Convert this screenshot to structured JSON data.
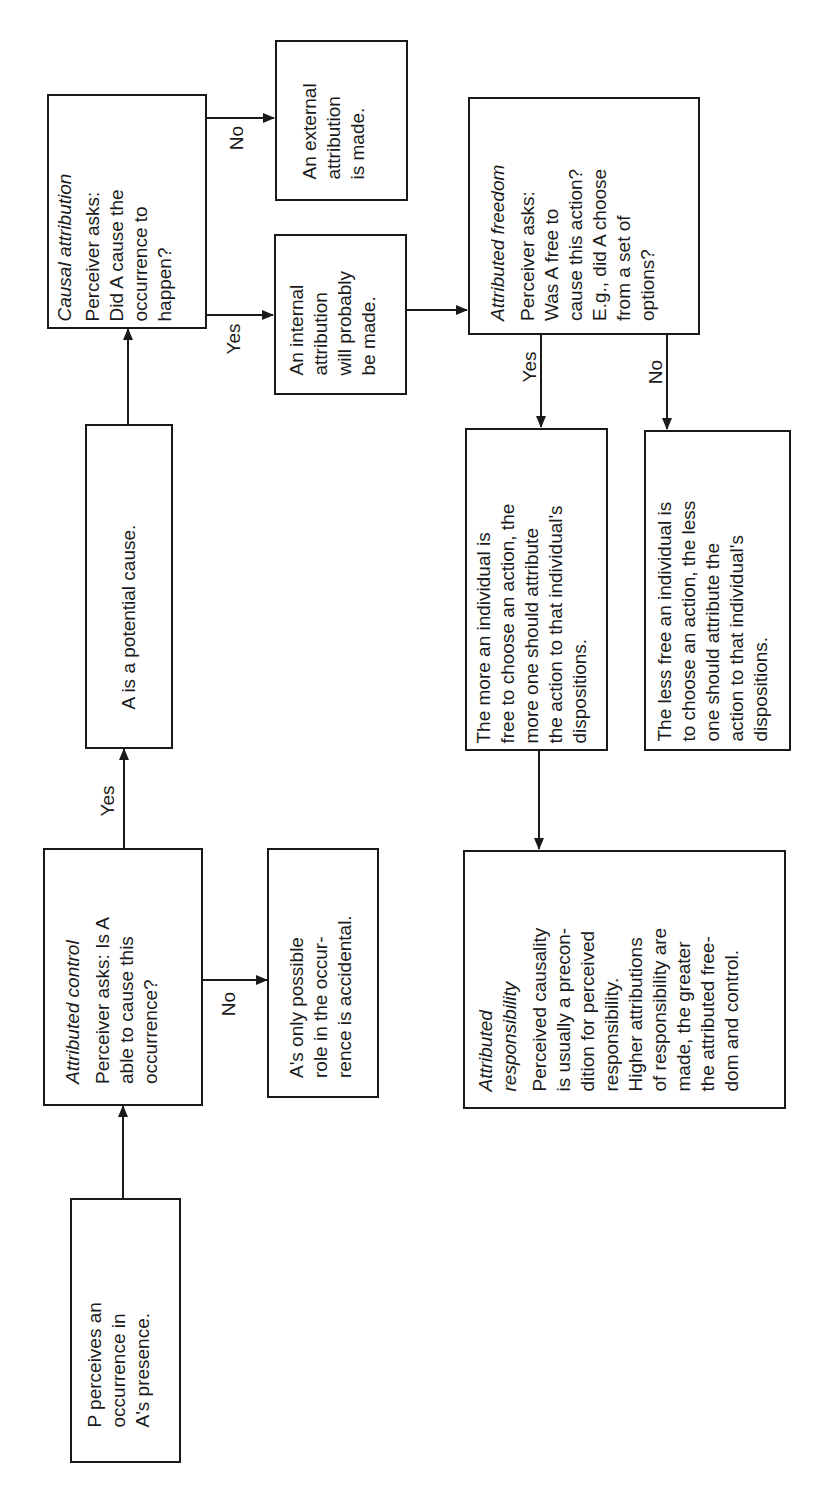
{
  "diagram": {
    "orientation": "rotated 90 degrees counter-clockwise",
    "nodes": {
      "start": {
        "lines": [
          "P perceives an",
          "occurrence in",
          "A's presence."
        ]
      },
      "control": {
        "heading": "Attributed control",
        "lines": [
          "Perceiver asks: Is A",
          "able to cause this",
          "occurrence?"
        ]
      },
      "accidental": {
        "lines": [
          "A's only possible",
          "role in the occur-",
          "rence is accidental."
        ]
      },
      "potential": {
        "lines": [
          "A is a potential cause."
        ]
      },
      "causal": {
        "heading": "Causal attribution",
        "lines": [
          "Perceiver asks:",
          "Did A cause the",
          "occurrence to",
          "happen?"
        ]
      },
      "external": {
        "lines": [
          "An external",
          "attribution",
          "is made."
        ]
      },
      "internal": {
        "lines": [
          "An internal",
          "attribution",
          "will probably",
          "be made."
        ]
      },
      "freedom": {
        "heading": "Attributed freedom",
        "lines": [
          "Perceiver asks:",
          "Was A free to",
          "cause this action?",
          "E.g., did A choose",
          "from a set of",
          "options?"
        ]
      },
      "more_free": {
        "lines": [
          "The more an individual is",
          "free to choose an action, the",
          "more one should attribute",
          "the action to that individual's",
          "dispositions."
        ]
      },
      "less_free": {
        "lines": [
          "The less free an individual is",
          "to choose an action, the less",
          "one should attribute the",
          "action to that individual's",
          "dispositions."
        ]
      },
      "responsibility": {
        "heading_lines": [
          "Attributed",
          "responsibility"
        ],
        "lines": [
          "Perceived causality",
          "is usually a precon-",
          "dition for perceived",
          "responsibility.",
          "Higher attributions",
          "of responsibility are",
          "made, the greater",
          "the attributed free-",
          "dom and control."
        ]
      }
    },
    "edge_labels": {
      "control_yes": "Yes",
      "control_no": "No",
      "causal_no": "No",
      "causal_yes": "Yes",
      "freedom_yes": "Yes",
      "freedom_no": "No"
    }
  }
}
